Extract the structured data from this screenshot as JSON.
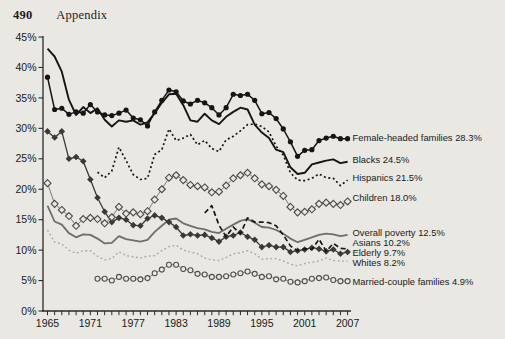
{
  "page": {
    "page_number": "490",
    "section_title": "Appendix"
  },
  "chart_data": {
    "type": "line",
    "title": "",
    "xlabel": "",
    "ylabel": "",
    "xlim": [
      1965,
      2007
    ],
    "ylim": [
      0,
      45
    ],
    "grid": false,
    "legend_position": "end-of-line annotations (right side)",
    "x_tick_labels": [
      "1965",
      "1971",
      "1977",
      "1983",
      "1989",
      "1995",
      "2001",
      "2007"
    ],
    "x_tick_years": [
      1965,
      1971,
      1977,
      1983,
      1989,
      1995,
      2001,
      2007
    ],
    "minor_x_ticks_every_year": true,
    "y_tick_labels": [
      "0%",
      "5%",
      "10%",
      "15%",
      "20%",
      "25%",
      "30%",
      "35%",
      "40%",
      "45%"
    ],
    "y_tick_values": [
      0,
      5,
      10,
      15,
      20,
      25,
      30,
      35,
      40,
      45
    ],
    "axis_color": "#2a2a28",
    "text_color": "#1a1a19",
    "series": [
      {
        "id": "whites",
        "name": "Whites",
        "end_label": "Whites 8.2%",
        "label_y_px": 263,
        "start_year": 1965,
        "color": "#a9a8a4",
        "width": 1.4,
        "dash": "1.8,2.6",
        "marker": "none",
        "values": [
          13.3,
          11.3,
          11.0,
          10.0,
          9.5,
          9.9,
          9.9,
          9.0,
          8.4,
          8.6,
          9.7,
          9.1,
          8.9,
          8.7,
          9.0,
          9.1,
          9.9,
          10.6,
          10.8,
          10.0,
          9.7,
          9.4,
          8.7,
          8.4,
          8.3,
          8.8,
          9.4,
          9.6,
          9.9,
          9.4,
          8.5,
          8.6,
          8.6,
          8.2,
          7.7,
          7.4,
          7.8,
          8.0,
          8.2,
          8.7,
          8.3,
          8.2,
          8.2
        ]
      },
      {
        "id": "married",
        "name": "Married-couple families",
        "end_label": "Married-couple families 4.9%",
        "label_y_px": 282,
        "start_year": 1972,
        "color": "#8c8b87",
        "width": 1.0,
        "dash": "",
        "marker": "circle-open",
        "marker_stroke": "#4f4e4b",
        "marker_size": 2.5,
        "values": [
          5.3,
          5.3,
          5.0,
          5.6,
          5.3,
          5.3,
          5.2,
          5.4,
          6.2,
          6.8,
          7.6,
          7.6,
          6.9,
          6.7,
          6.1,
          6.0,
          5.6,
          5.6,
          5.7,
          6.0,
          6.2,
          6.5,
          6.1,
          5.6,
          5.7,
          5.2,
          5.3,
          4.8,
          4.7,
          4.9,
          5.3,
          5.4,
          5.5,
          5.1,
          4.9,
          4.9
        ]
      },
      {
        "id": "overall",
        "name": "Overall poverty",
        "end_label": "Overall poverty 12.5%",
        "label_y_px": 233,
        "start_year": 1965,
        "color": "#6f6e6a",
        "width": 1.8,
        "dash": "",
        "marker": "none",
        "values": [
          17.3,
          14.7,
          14.2,
          12.8,
          12.1,
          12.6,
          12.5,
          11.9,
          11.1,
          11.2,
          12.3,
          11.8,
          11.6,
          11.4,
          11.7,
          13.0,
          14.0,
          15.0,
          15.2,
          14.4,
          14.0,
          13.6,
          13.4,
          13.0,
          12.8,
          13.5,
          14.2,
          14.8,
          15.1,
          14.5,
          13.8,
          13.7,
          13.3,
          12.7,
          11.9,
          11.3,
          11.7,
          12.1,
          12.5,
          12.7,
          12.6,
          12.3,
          12.5
        ]
      },
      {
        "id": "elderly",
        "name": "Elderly",
        "end_label": "Elderly 9.7%",
        "label_y_px": 253,
        "start_year": 1965,
        "color": "#3a3937",
        "width": 1.3,
        "dash": "",
        "marker": "diamond-filled",
        "marker_stroke": "#3a3937",
        "marker_size": 2.9,
        "values": [
          29.5,
          28.5,
          29.5,
          25.0,
          25.3,
          24.6,
          21.6,
          18.6,
          16.3,
          14.6,
          15.3,
          15.0,
          14.1,
          14.0,
          15.2,
          15.7,
          15.3,
          14.6,
          13.8,
          12.4,
          12.6,
          12.4,
          12.5,
          12.0,
          11.4,
          12.2,
          12.4,
          12.9,
          12.2,
          11.7,
          10.5,
          10.8,
          10.5,
          10.5,
          9.7,
          9.9,
          10.1,
          10.4,
          10.2,
          9.8,
          10.1,
          9.4,
          9.7
        ]
      },
      {
        "id": "asians",
        "name": "Asians",
        "end_label": "Asians 10.2%",
        "label_y_px": 243,
        "start_year": 1987,
        "color": "#151515",
        "width": 1.7,
        "dash": "5,3",
        "marker": "none",
        "values": [
          16.1,
          17.3,
          14.1,
          12.2,
          13.8,
          12.7,
          15.3,
          14.6,
          14.6,
          14.5,
          14.0,
          12.5,
          10.7,
          9.9,
          10.2,
          10.1,
          11.8,
          9.8,
          11.1,
          10.3,
          10.2
        ]
      },
      {
        "id": "children",
        "name": "Children",
        "end_label": "Children 18.0%",
        "label_y_px": 198,
        "start_year": 1965,
        "color": "#7a7975",
        "width": 1.0,
        "dash": "",
        "marker": "diamond-open",
        "marker_stroke": "#4a4946",
        "marker_size": 3.1,
        "values": [
          21.0,
          17.6,
          16.6,
          15.6,
          14.0,
          15.1,
          15.3,
          15.1,
          14.4,
          15.4,
          17.1,
          16.0,
          16.2,
          15.9,
          16.4,
          18.3,
          20.0,
          21.9,
          22.3,
          21.5,
          20.7,
          20.5,
          20.3,
          19.5,
          19.6,
          20.6,
          21.8,
          22.3,
          22.7,
          21.8,
          20.8,
          20.5,
          19.9,
          18.9,
          17.1,
          16.2,
          16.3,
          16.7,
          17.6,
          17.8,
          17.6,
          17.4,
          18.0
        ]
      },
      {
        "id": "hispanics",
        "name": "Hispanics",
        "end_label": "Hispanics 21.5%",
        "label_y_px": 178,
        "start_year": 1972,
        "color": "#151515",
        "width": 1.7,
        "dash": "2,2.6",
        "marker": "none",
        "values": [
          22.8,
          21.9,
          23.0,
          26.9,
          24.7,
          22.4,
          21.6,
          21.8,
          25.7,
          26.5,
          29.9,
          28.0,
          28.4,
          29.0,
          27.3,
          28.0,
          26.7,
          26.2,
          28.1,
          28.7,
          29.6,
          30.6,
          30.7,
          30.3,
          29.4,
          27.1,
          25.6,
          22.7,
          21.5,
          21.4,
          21.8,
          22.5,
          21.9,
          21.8,
          20.6,
          21.5
        ]
      },
      {
        "id": "blacks",
        "name": "Blacks",
        "end_label": "Blacks 24.5%",
        "label_y_px": 160,
        "start_year": 1965,
        "color": "#151515",
        "width": 1.9,
        "dash": "",
        "marker": "none",
        "values": [
          43.1,
          41.8,
          39.3,
          34.7,
          32.2,
          33.5,
          32.5,
          33.3,
          31.4,
          30.3,
          31.3,
          31.1,
          31.3,
          30.6,
          31.0,
          32.5,
          34.2,
          35.6,
          35.7,
          33.8,
          31.3,
          31.1,
          32.4,
          31.3,
          30.7,
          31.9,
          32.7,
          33.4,
          33.1,
          30.6,
          29.3,
          28.4,
          26.5,
          26.1,
          23.6,
          22.5,
          22.7,
          24.1,
          24.4,
          24.7,
          24.9,
          24.3,
          24.5
        ]
      },
      {
        "id": "female_headed",
        "name": "Female-headed families",
        "end_label": "Female-headed families 28.3%",
        "label_y_px": 138,
        "start_year": 1965,
        "color": "#151515",
        "width": 1.5,
        "dash": "",
        "marker": "circle-filled",
        "marker_stroke": "#151515",
        "marker_size": 2.6,
        "values": [
          38.4,
          33.1,
          33.3,
          32.3,
          32.7,
          32.5,
          33.9,
          32.7,
          32.2,
          32.1,
          32.5,
          33.0,
          31.7,
          31.4,
          30.4,
          32.7,
          34.6,
          36.3,
          36.0,
          34.5,
          34.0,
          34.6,
          34.2,
          33.4,
          32.2,
          33.4,
          35.6,
          35.4,
          35.6,
          34.6,
          32.4,
          32.6,
          31.6,
          29.9,
          27.8,
          25.4,
          26.4,
          26.5,
          28.0,
          28.4,
          28.7,
          28.3,
          28.3
        ]
      }
    ]
  }
}
